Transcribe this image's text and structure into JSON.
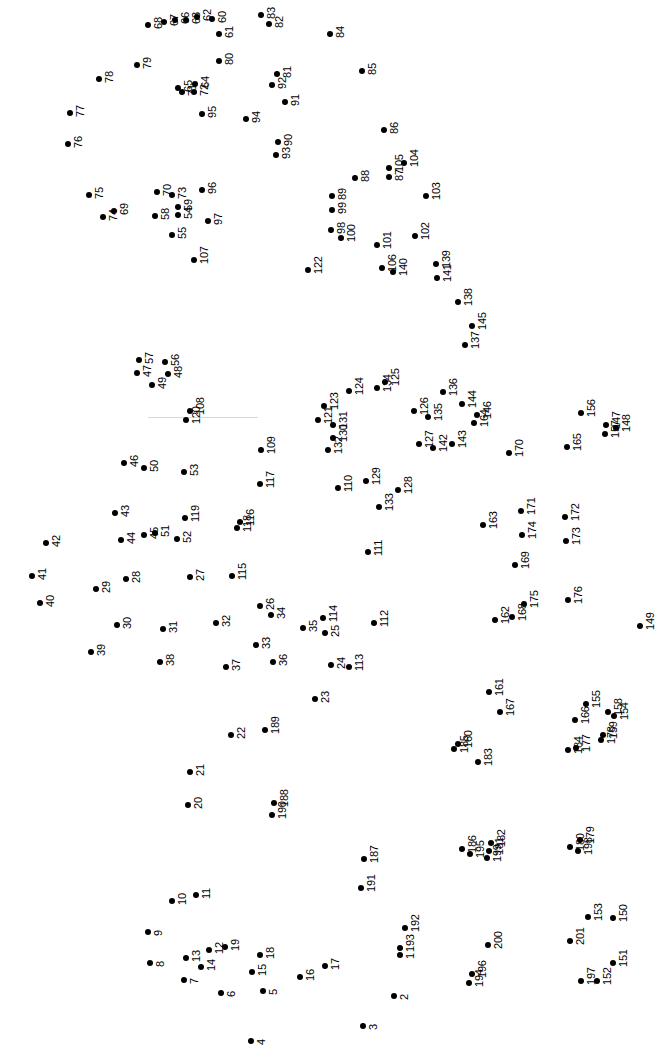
{
  "page": {
    "type": "connect-the-dots-puzzle",
    "background_color": "#ffffff",
    "dot_color": "#000000",
    "label_color": "#000000",
    "label_rotation_degrees": -90,
    "width": 658,
    "height": 1048,
    "dot_count": 201
  },
  "guide_line": {
    "x": 148,
    "y": 417,
    "width": 110,
    "color": "#d8d8d8"
  },
  "chart_data": {
    "type": "scatter",
    "title": "",
    "xlabel": "",
    "ylabel": "",
    "xlim": [
      0,
      658
    ],
    "ylim": [
      0,
      1048
    ],
    "grid": false,
    "legend": "none",
    "points": [
      {
        "label": "1",
        "x": 400,
        "y": 955
      },
      {
        "label": "2",
        "x": 394,
        "y": 996
      },
      {
        "label": "3",
        "x": 363,
        "y": 1026
      },
      {
        "label": "4",
        "x": 251,
        "y": 1041
      },
      {
        "label": "5",
        "x": 263,
        "y": 991
      },
      {
        "label": "6",
        "x": 221,
        "y": 993
      },
      {
        "label": "7",
        "x": 184,
        "y": 980
      },
      {
        "label": "8",
        "x": 150,
        "y": 963
      },
      {
        "label": "9",
        "x": 148,
        "y": 932
      },
      {
        "label": "10",
        "x": 172,
        "y": 901
      },
      {
        "label": "11",
        "x": 196,
        "y": 895
      },
      {
        "label": "12",
        "x": 209,
        "y": 950
      },
      {
        "label": "13",
        "x": 186,
        "y": 958
      },
      {
        "label": "14",
        "x": 201,
        "y": 967
      },
      {
        "label": "15",
        "x": 252,
        "y": 972
      },
      {
        "label": "16",
        "x": 300,
        "y": 977
      },
      {
        "label": "17",
        "x": 325,
        "y": 966
      },
      {
        "label": "18",
        "x": 260,
        "y": 955
      },
      {
        "label": "19",
        "x": 225,
        "y": 947
      },
      {
        "label": "20",
        "x": 188,
        "y": 805
      },
      {
        "label": "21",
        "x": 190,
        "y": 772
      },
      {
        "label": "22",
        "x": 231,
        "y": 735
      },
      {
        "label": "23",
        "x": 315,
        "y": 699
      },
      {
        "label": "24",
        "x": 331,
        "y": 665
      },
      {
        "label": "25",
        "x": 325,
        "y": 633
      },
      {
        "label": "26",
        "x": 260,
        "y": 606
      },
      {
        "label": "27",
        "x": 190,
        "y": 577
      },
      {
        "label": "28",
        "x": 126,
        "y": 579
      },
      {
        "label": "29",
        "x": 96,
        "y": 589
      },
      {
        "label": "30",
        "x": 117,
        "y": 625
      },
      {
        "label": "31",
        "x": 163,
        "y": 629
      },
      {
        "label": "32",
        "x": 216,
        "y": 623
      },
      {
        "label": "33",
        "x": 256,
        "y": 645
      },
      {
        "label": "34",
        "x": 271,
        "y": 615
      },
      {
        "label": "35",
        "x": 303,
        "y": 628
      },
      {
        "label": "36",
        "x": 273,
        "y": 662
      },
      {
        "label": "37",
        "x": 226,
        "y": 667
      },
      {
        "label": "38",
        "x": 160,
        "y": 662
      },
      {
        "label": "39",
        "x": 91,
        "y": 652
      },
      {
        "label": "40",
        "x": 40,
        "y": 603
      },
      {
        "label": "41",
        "x": 32,
        "y": 576
      },
      {
        "label": "42",
        "x": 46,
        "y": 543
      },
      {
        "label": "43",
        "x": 115,
        "y": 513
      },
      {
        "label": "44",
        "x": 121,
        "y": 540
      },
      {
        "label": "45",
        "x": 144,
        "y": 535
      },
      {
        "label": "46",
        "x": 124,
        "y": 463
      },
      {
        "label": "47",
        "x": 137,
        "y": 373
      },
      {
        "label": "48",
        "x": 168,
        "y": 374
      },
      {
        "label": "49",
        "x": 152,
        "y": 385
      },
      {
        "label": "50",
        "x": 144,
        "y": 468
      },
      {
        "label": "51",
        "x": 155,
        "y": 533
      },
      {
        "label": "52",
        "x": 177,
        "y": 539
      },
      {
        "label": "53",
        "x": 184,
        "y": 472
      },
      {
        "label": "54",
        "x": 178,
        "y": 215
      },
      {
        "label": "55",
        "x": 172,
        "y": 235
      },
      {
        "label": "56",
        "x": 165,
        "y": 362
      },
      {
        "label": "57",
        "x": 139,
        "y": 360
      },
      {
        "label": "58",
        "x": 155,
        "y": 216
      },
      {
        "label": "59",
        "x": 178,
        "y": 207
      },
      {
        "label": "60",
        "x": 212,
        "y": 19
      },
      {
        "label": "61",
        "x": 219,
        "y": 34
      },
      {
        "label": "62",
        "x": 197,
        "y": 17
      },
      {
        "label": "63",
        "x": 186,
        "y": 20
      },
      {
        "label": "64",
        "x": 195,
        "y": 84
      },
      {
        "label": "65",
        "x": 178,
        "y": 88
      },
      {
        "label": "66",
        "x": 175,
        "y": 20
      },
      {
        "label": "67",
        "x": 164,
        "y": 22
      },
      {
        "label": "68",
        "x": 148,
        "y": 25
      },
      {
        "label": "69",
        "x": 114,
        "y": 211
      },
      {
        "label": "70",
        "x": 157,
        "y": 192
      },
      {
        "label": "71",
        "x": 182,
        "y": 92
      },
      {
        "label": "72",
        "x": 194,
        "y": 92
      },
      {
        "label": "73",
        "x": 172,
        "y": 195
      },
      {
        "label": "74",
        "x": 103,
        "y": 217
      },
      {
        "label": "75",
        "x": 89,
        "y": 195
      },
      {
        "label": "76",
        "x": 68,
        "y": 144
      },
      {
        "label": "77",
        "x": 70,
        "y": 113
      },
      {
        "label": "78",
        "x": 99,
        "y": 79
      },
      {
        "label": "79",
        "x": 137,
        "y": 65
      },
      {
        "label": "80",
        "x": 219,
        "y": 61
      },
      {
        "label": "81",
        "x": 277,
        "y": 74
      },
      {
        "label": "82",
        "x": 269,
        "y": 24
      },
      {
        "label": "83",
        "x": 261,
        "y": 15
      },
      {
        "label": "84",
        "x": 330,
        "y": 34
      },
      {
        "label": "85",
        "x": 362,
        "y": 71
      },
      {
        "label": "86",
        "x": 384,
        "y": 130
      },
      {
        "label": "87",
        "x": 389,
        "y": 177
      },
      {
        "label": "88",
        "x": 355,
        "y": 178
      },
      {
        "label": "89",
        "x": 332,
        "y": 196
      },
      {
        "label": "90",
        "x": 278,
        "y": 142
      },
      {
        "label": "91",
        "x": 285,
        "y": 102
      },
      {
        "label": "92",
        "x": 272,
        "y": 85
      },
      {
        "label": "93",
        "x": 276,
        "y": 155
      },
      {
        "label": "94",
        "x": 246,
        "y": 119
      },
      {
        "label": "95",
        "x": 202,
        "y": 114
      },
      {
        "label": "96",
        "x": 202,
        "y": 190
      },
      {
        "label": "97",
        "x": 208,
        "y": 221
      },
      {
        "label": "98",
        "x": 331,
        "y": 230
      },
      {
        "label": "99",
        "x": 332,
        "y": 210
      },
      {
        "label": "100",
        "x": 341,
        "y": 238
      },
      {
        "label": "101",
        "x": 377,
        "y": 245
      },
      {
        "label": "102",
        "x": 415,
        "y": 236
      },
      {
        "label": "103",
        "x": 426,
        "y": 196
      },
      {
        "label": "104",
        "x": 404,
        "y": 163
      },
      {
        "label": "105",
        "x": 389,
        "y": 168
      },
      {
        "label": "106",
        "x": 382,
        "y": 268
      },
      {
        "label": "107",
        "x": 194,
        "y": 260
      },
      {
        "label": "108",
        "x": 190,
        "y": 411
      },
      {
        "label": "109",
        "x": 261,
        "y": 450
      },
      {
        "label": "110",
        "x": 338,
        "y": 488
      },
      {
        "label": "111",
        "x": 368,
        "y": 552
      },
      {
        "label": "112",
        "x": 374,
        "y": 623
      },
      {
        "label": "113",
        "x": 349,
        "y": 667
      },
      {
        "label": "114",
        "x": 323,
        "y": 618
      },
      {
        "label": "115",
        "x": 232,
        "y": 576
      },
      {
        "label": "116",
        "x": 240,
        "y": 522
      },
      {
        "label": "117",
        "x": 260,
        "y": 484
      },
      {
        "label": "118",
        "x": 237,
        "y": 528
      },
      {
        "label": "119",
        "x": 185,
        "y": 518
      },
      {
        "label": "120",
        "x": 186,
        "y": 420
      },
      {
        "label": "121",
        "x": 318,
        "y": 420
      },
      {
        "label": "122",
        "x": 308,
        "y": 270
      },
      {
        "label": "123",
        "x": 324,
        "y": 406
      },
      {
        "label": "124",
        "x": 349,
        "y": 391
      },
      {
        "label": "125",
        "x": 385,
        "y": 382
      },
      {
        "label": "126",
        "x": 414,
        "y": 411
      },
      {
        "label": "127",
        "x": 419,
        "y": 444
      },
      {
        "label": "128",
        "x": 398,
        "y": 490
      },
      {
        "label": "129",
        "x": 366,
        "y": 481
      },
      {
        "label": "130",
        "x": 333,
        "y": 438
      },
      {
        "label": "131",
        "x": 333,
        "y": 425
      },
      {
        "label": "132",
        "x": 328,
        "y": 450
      },
      {
        "label": "133",
        "x": 379,
        "y": 507
      },
      {
        "label": "134",
        "x": 377,
        "y": 388
      },
      {
        "label": "135",
        "x": 428,
        "y": 417
      },
      {
        "label": "136",
        "x": 443,
        "y": 392
      },
      {
        "label": "137",
        "x": 465,
        "y": 345
      },
      {
        "label": "138",
        "x": 458,
        "y": 302
      },
      {
        "label": "139",
        "x": 436,
        "y": 264
      },
      {
        "label": "140",
        "x": 393,
        "y": 272
      },
      {
        "label": "141",
        "x": 437,
        "y": 278
      },
      {
        "label": "142",
        "x": 433,
        "y": 448
      },
      {
        "label": "143",
        "x": 452,
        "y": 444
      },
      {
        "label": "144",
        "x": 462,
        "y": 404
      },
      {
        "label": "145",
        "x": 472,
        "y": 326
      },
      {
        "label": "146",
        "x": 477,
        "y": 415
      },
      {
        "label": "147",
        "x": 606,
        "y": 425
      },
      {
        "label": "148",
        "x": 616,
        "y": 428
      },
      {
        "label": "149",
        "x": 640,
        "y": 626
      },
      {
        "label": "150",
        "x": 613,
        "y": 918
      },
      {
        "label": "151",
        "x": 613,
        "y": 963
      },
      {
        "label": "152",
        "x": 597,
        "y": 981
      },
      {
        "label": "153",
        "x": 588,
        "y": 917
      },
      {
        "label": "154",
        "x": 614,
        "y": 716
      },
      {
        "label": "155",
        "x": 586,
        "y": 704
      },
      {
        "label": "156",
        "x": 581,
        "y": 413
      },
      {
        "label": "157",
        "x": 605,
        "y": 434
      },
      {
        "label": "158",
        "x": 608,
        "y": 712
      },
      {
        "label": "159",
        "x": 603,
        "y": 735
      },
      {
        "label": "160",
        "x": 458,
        "y": 744
      },
      {
        "label": "161",
        "x": 489,
        "y": 692
      },
      {
        "label": "162",
        "x": 495,
        "y": 620
      },
      {
        "label": "163",
        "x": 483,
        "y": 525
      },
      {
        "label": "164",
        "x": 474,
        "y": 423
      },
      {
        "label": "165",
        "x": 567,
        "y": 447
      },
      {
        "label": "166",
        "x": 575,
        "y": 720
      },
      {
        "label": "167",
        "x": 500,
        "y": 712
      },
      {
        "label": "168",
        "x": 512,
        "y": 617
      },
      {
        "label": "169",
        "x": 515,
        "y": 565
      },
      {
        "label": "170",
        "x": 509,
        "y": 453
      },
      {
        "label": "171",
        "x": 521,
        "y": 511
      },
      {
        "label": "172",
        "x": 565,
        "y": 517
      },
      {
        "label": "173",
        "x": 566,
        "y": 541
      },
      {
        "label": "174",
        "x": 522,
        "y": 535
      },
      {
        "label": "175",
        "x": 524,
        "y": 604
      },
      {
        "label": "176",
        "x": 568,
        "y": 600
      },
      {
        "label": "177",
        "x": 576,
        "y": 748
      },
      {
        "label": "178",
        "x": 601,
        "y": 740
      },
      {
        "label": "179",
        "x": 580,
        "y": 840
      },
      {
        "label": "180",
        "x": 570,
        "y": 847
      },
      {
        "label": "181",
        "x": 489,
        "y": 851
      },
      {
        "label": "182",
        "x": 491,
        "y": 843
      },
      {
        "label": "183",
        "x": 478,
        "y": 762
      },
      {
        "label": "184",
        "x": 568,
        "y": 750
      },
      {
        "label": "185",
        "x": 454,
        "y": 749
      },
      {
        "label": "186",
        "x": 462,
        "y": 849
      },
      {
        "label": "187",
        "x": 364,
        "y": 859
      },
      {
        "label": "188",
        "x": 274,
        "y": 803
      },
      {
        "label": "189",
        "x": 265,
        "y": 730
      },
      {
        "label": "190",
        "x": 272,
        "y": 815
      },
      {
        "label": "191",
        "x": 361,
        "y": 888
      },
      {
        "label": "192",
        "x": 405,
        "y": 928
      },
      {
        "label": "193",
        "x": 400,
        "y": 948
      },
      {
        "label": "194",
        "x": 469,
        "y": 983
      },
      {
        "label": "195",
        "x": 470,
        "y": 854
      },
      {
        "label": "196",
        "x": 472,
        "y": 974
      },
      {
        "label": "197",
        "x": 581,
        "y": 981
      },
      {
        "label": "198",
        "x": 578,
        "y": 851
      },
      {
        "label": "199",
        "x": 487,
        "y": 858
      },
      {
        "label": "200",
        "x": 488,
        "y": 945
      },
      {
        "label": "201",
        "x": 570,
        "y": 941
      }
    ]
  }
}
